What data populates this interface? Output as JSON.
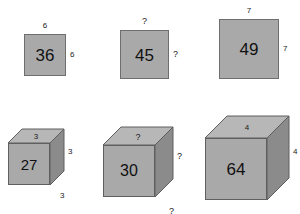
{
  "canvas": {
    "width": 300,
    "height": 214,
    "background": "#ffffff"
  },
  "palette": {
    "face_fill": "#a9a9a9",
    "top_fill": "#b7b7b7",
    "side_fill": "#8b8b8b",
    "stroke": "#5f5f5f",
    "text": "#111111"
  },
  "top_row": {
    "title": "squares",
    "items": [
      {
        "id": "square-36",
        "face_value": "36",
        "top_label": "6",
        "right_label": "6",
        "x": 24,
        "y": 34,
        "size": 42,
        "value_font": 17,
        "label_font": 8
      },
      {
        "id": "square-45",
        "face_value": "45",
        "top_label": "?",
        "right_label": "?",
        "x": 120,
        "y": 30,
        "size": 49,
        "value_font": 17,
        "label_font": 9
      },
      {
        "id": "square-49",
        "face_value": "49",
        "top_label": "7",
        "right_label": "7",
        "x": 219,
        "y": 19,
        "size": 60,
        "value_font": 17,
        "label_font": 8
      }
    ]
  },
  "bottom_row": {
    "title": "cubes",
    "items": [
      {
        "id": "cube-27",
        "face_value": "27",
        "top_label": "3",
        "right_upper_label": "3",
        "right_lower_label": "3",
        "x": 8,
        "y": 143,
        "size": 42,
        "depth": 14,
        "value_font": 15,
        "label_font": 8
      },
      {
        "id": "cube-30",
        "face_value": "30",
        "top_label": "?",
        "right_upper_label": "?",
        "right_lower_label": "?",
        "x": 103,
        "y": 145,
        "size": 52,
        "depth": 18,
        "value_font": 16,
        "label_font": 9
      },
      {
        "id": "cube-64",
        "face_value": "64",
        "top_label": "4",
        "right_upper_label": "4",
        "right_lower_label": "4",
        "x": 205,
        "y": 138,
        "size": 62,
        "depth": 22,
        "value_font": 17,
        "label_font": 8
      }
    ]
  }
}
